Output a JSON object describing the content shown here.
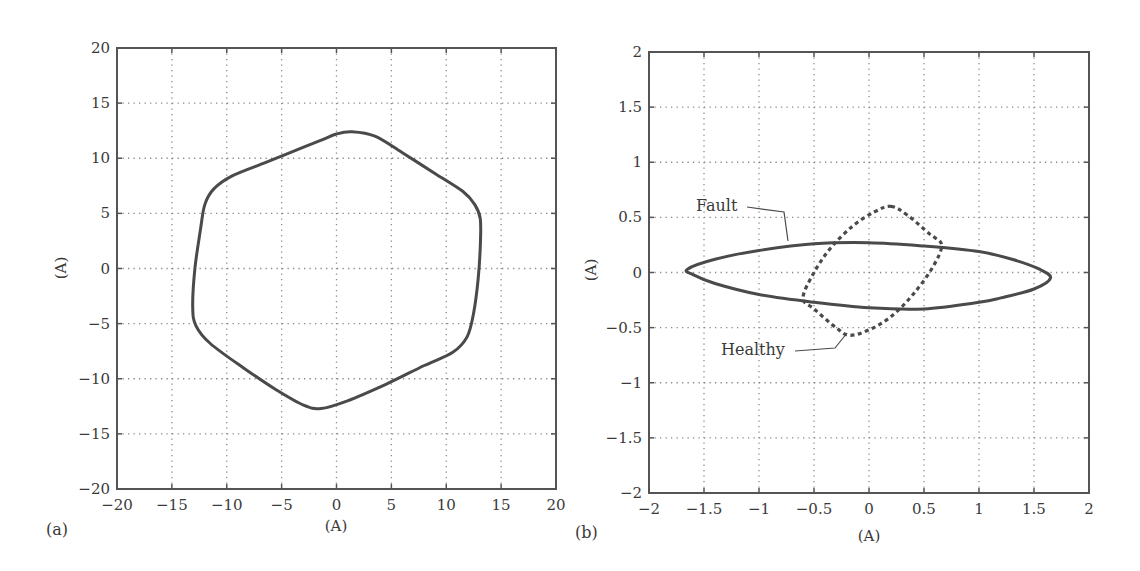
{
  "colors": {
    "line": "#4a4a4a",
    "grid": "#8a8a8a",
    "axis": "#555555",
    "text": "#3a3a3a"
  },
  "chart_data": [
    {
      "id": "a",
      "type": "line",
      "panel_label": "(a)",
      "title": "",
      "xlabel": "(A)",
      "ylabel": "(A)",
      "xlim": [
        -20,
        20
      ],
      "ylim": [
        -20,
        20
      ],
      "xticks": [
        -20,
        -15,
        -10,
        -5,
        0,
        5,
        10,
        15,
        20
      ],
      "yticks": [
        -20,
        -15,
        -10,
        -5,
        0,
        5,
        10,
        15,
        20
      ],
      "xtick_labels": [
        "−20",
        "−15",
        "−10",
        "−5",
        "0",
        "5",
        "10",
        "15",
        "20"
      ],
      "ytick_labels": [
        "−20",
        "−15",
        "−10",
        "−5",
        "0",
        "5",
        "10",
        "15",
        "20"
      ],
      "grid": true,
      "series": [
        {
          "name": "Current trajectory",
          "style": "solid",
          "closed": true,
          "points": [
            [
              1.4,
              12.4
            ],
            [
              3.5,
              12.0
            ],
            [
              6.0,
              10.5
            ],
            [
              9.0,
              8.6
            ],
            [
              11.5,
              7.0
            ],
            [
              12.6,
              5.8
            ],
            [
              13.1,
              4.5
            ],
            [
              13.1,
              2.0
            ],
            [
              12.9,
              -1.0
            ],
            [
              12.5,
              -4.0
            ],
            [
              11.9,
              -6.2
            ],
            [
              10.6,
              -7.6
            ],
            [
              8.0,
              -8.8
            ],
            [
              4.5,
              -10.5
            ],
            [
              1.0,
              -12.0
            ],
            [
              -1.4,
              -12.7
            ],
            [
              -3.0,
              -12.4
            ],
            [
              -5.5,
              -11.0
            ],
            [
              -8.5,
              -9.0
            ],
            [
              -11.5,
              -6.8
            ],
            [
              -12.8,
              -5.2
            ],
            [
              -13.1,
              -3.5
            ],
            [
              -12.9,
              0.0
            ],
            [
              -12.4,
              3.5
            ],
            [
              -12.0,
              5.8
            ],
            [
              -11.2,
              7.2
            ],
            [
              -9.5,
              8.4
            ],
            [
              -6.5,
              9.6
            ],
            [
              -4.0,
              10.6
            ],
            [
              -1.5,
              11.6
            ],
            [
              0.0,
              12.2
            ]
          ]
        }
      ]
    },
    {
      "id": "b",
      "type": "line",
      "panel_label": "(b)",
      "title": "",
      "xlabel": "(A)",
      "ylabel": "(A)",
      "xlim": [
        -2,
        2
      ],
      "ylim": [
        -2,
        2
      ],
      "xticks": [
        -2,
        -1.5,
        -1,
        -0.5,
        0,
        0.5,
        1,
        1.5,
        2
      ],
      "yticks": [
        -2,
        -1.5,
        -1,
        -0.5,
        0,
        0.5,
        1,
        1.5,
        2
      ],
      "xtick_labels": [
        "−2",
        "−1.5",
        "−1",
        "−0.5",
        "0",
        "0.5",
        "1",
        "1.5",
        "2"
      ],
      "ytick_labels": [
        "−2",
        "−1.5",
        "−1",
        "−0.5",
        "0",
        "0.5",
        "1",
        "1.5",
        "2"
      ],
      "grid": true,
      "series": [
        {
          "name": "Fault",
          "style": "solid",
          "closed": true,
          "points": [
            [
              -1.65,
              0.03
            ],
            [
              -1.4,
              0.12
            ],
            [
              -1.0,
              0.2
            ],
            [
              -0.5,
              0.26
            ],
            [
              0.0,
              0.27
            ],
            [
              0.5,
              0.24
            ],
            [
              1.0,
              0.19
            ],
            [
              1.3,
              0.12
            ],
            [
              1.55,
              0.03
            ],
            [
              1.65,
              -0.05
            ],
            [
              1.5,
              -0.15
            ],
            [
              1.2,
              -0.23
            ],
            [
              1.0,
              -0.27
            ],
            [
              0.5,
              -0.33
            ],
            [
              0.0,
              -0.32
            ],
            [
              -0.5,
              -0.27
            ],
            [
              -1.0,
              -0.2
            ],
            [
              -1.4,
              -0.1
            ],
            [
              -1.6,
              -0.02
            ]
          ]
        },
        {
          "name": "Healthy",
          "style": "dashed",
          "closed": true,
          "points": [
            [
              0.2,
              0.6
            ],
            [
              0.35,
              0.52
            ],
            [
              0.55,
              0.35
            ],
            [
              0.66,
              0.25
            ],
            [
              0.58,
              0.05
            ],
            [
              0.4,
              -0.2
            ],
            [
              0.2,
              -0.4
            ],
            [
              0.0,
              -0.52
            ],
            [
              -0.18,
              -0.57
            ],
            [
              -0.3,
              -0.5
            ],
            [
              -0.5,
              -0.33
            ],
            [
              -0.6,
              -0.23
            ],
            [
              -0.5,
              0.0
            ],
            [
              -0.35,
              0.22
            ],
            [
              -0.15,
              0.42
            ],
            [
              0.05,
              0.55
            ]
          ]
        }
      ],
      "annotations": [
        {
          "text": "Fault",
          "target": "Fault"
        },
        {
          "text": "Healthy",
          "target": "Healthy"
        }
      ]
    }
  ]
}
